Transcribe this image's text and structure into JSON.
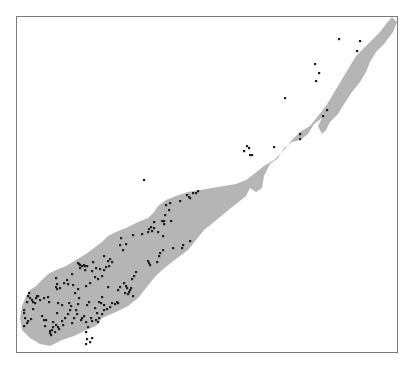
{
  "map": {
    "frame": {
      "x": 16,
      "y": 16,
      "width": 381,
      "height": 336,
      "stroke": "#7a7a7a"
    },
    "colors": {
      "land": "#b5b5b5",
      "points": "#1e1e1e",
      "background": "#ffffff"
    },
    "landmass": {
      "name": "peninsula",
      "outline": [
        [
          392,
          17
        ],
        [
          397,
          22
        ],
        [
          393,
          32
        ],
        [
          384,
          44
        ],
        [
          376,
          52
        ],
        [
          370,
          62
        ],
        [
          366,
          72
        ],
        [
          360,
          82
        ],
        [
          352,
          92
        ],
        [
          344,
          104
        ],
        [
          338,
          114
        ],
        [
          330,
          122
        ],
        [
          326,
          130
        ],
        [
          322,
          134
        ],
        [
          318,
          126
        ],
        [
          322,
          118
        ],
        [
          314,
          124
        ],
        [
          308,
          134
        ],
        [
          300,
          140
        ],
        [
          292,
          142
        ],
        [
          284,
          148
        ],
        [
          278,
          158
        ],
        [
          270,
          164
        ],
        [
          264,
          176
        ],
        [
          262,
          188
        ],
        [
          256,
          192
        ],
        [
          250,
          188
        ],
        [
          246,
          196
        ],
        [
          236,
          204
        ],
        [
          226,
          212
        ],
        [
          214,
          222
        ],
        [
          204,
          230
        ],
        [
          196,
          240
        ],
        [
          188,
          250
        ],
        [
          180,
          256
        ],
        [
          172,
          262
        ],
        [
          162,
          270
        ],
        [
          154,
          278
        ],
        [
          146,
          288
        ],
        [
          138,
          298
        ],
        [
          128,
          306
        ],
        [
          116,
          312
        ],
        [
          102,
          318
        ],
        [
          96,
          326
        ],
        [
          86,
          330
        ],
        [
          74,
          336
        ],
        [
          62,
          340
        ],
        [
          50,
          346
        ],
        [
          40,
          344
        ],
        [
          30,
          338
        ],
        [
          22,
          330
        ],
        [
          20,
          318
        ],
        [
          22,
          306
        ],
        [
          26,
          296
        ],
        [
          30,
          290
        ],
        [
          36,
          286
        ],
        [
          42,
          280
        ],
        [
          48,
          274
        ],
        [
          56,
          270
        ],
        [
          66,
          266
        ],
        [
          76,
          260
        ],
        [
          86,
          254
        ],
        [
          94,
          248
        ],
        [
          102,
          242
        ],
        [
          108,
          236
        ],
        [
          116,
          232
        ],
        [
          126,
          228
        ],
        [
          138,
          222
        ],
        [
          148,
          218
        ],
        [
          154,
          212
        ],
        [
          158,
          206
        ],
        [
          166,
          200
        ],
        [
          176,
          196
        ],
        [
          188,
          192
        ],
        [
          200,
          190
        ],
        [
          212,
          188
        ],
        [
          224,
          186
        ],
        [
          236,
          184
        ],
        [
          246,
          180
        ],
        [
          254,
          174
        ],
        [
          264,
          166
        ],
        [
          274,
          160
        ],
        [
          284,
          150
        ],
        [
          292,
          140
        ],
        [
          300,
          132
        ],
        [
          310,
          126
        ],
        [
          318,
          116
        ],
        [
          326,
          106
        ],
        [
          332,
          96
        ],
        [
          338,
          86
        ],
        [
          344,
          76
        ],
        [
          350,
          66
        ],
        [
          356,
          56
        ],
        [
          364,
          48
        ],
        [
          372,
          40
        ],
        [
          380,
          32
        ],
        [
          386,
          24
        ]
      ]
    },
    "points": [
      [
        339,
        39
      ],
      [
        360,
        41
      ],
      [
        357,
        51
      ],
      [
        315,
        64
      ],
      [
        319,
        73
      ],
      [
        316,
        81
      ],
      [
        285,
        98
      ],
      [
        327,
        110
      ],
      [
        323,
        116
      ],
      [
        300,
        134
      ],
      [
        300,
        139
      ],
      [
        247,
        146
      ],
      [
        249,
        148
      ],
      [
        244,
        151
      ],
      [
        252,
        155
      ],
      [
        250,
        155
      ],
      [
        274,
        147
      ],
      [
        144,
        180
      ],
      [
        187,
        195
      ],
      [
        189,
        197
      ],
      [
        193,
        193
      ],
      [
        196,
        193
      ],
      [
        198,
        191
      ],
      [
        190,
        198
      ],
      [
        180,
        201
      ],
      [
        170,
        203
      ],
      [
        166,
        205
      ],
      [
        169,
        210
      ],
      [
        165,
        215
      ],
      [
        164,
        221
      ],
      [
        162,
        221
      ],
      [
        164,
        224
      ],
      [
        171,
        221
      ],
      [
        154,
        222
      ],
      [
        151,
        227
      ],
      [
        149,
        229
      ],
      [
        152,
        231
      ],
      [
        154,
        228
      ],
      [
        163,
        236
      ],
      [
        148,
        232
      ],
      [
        142,
        234
      ],
      [
        133,
        235
      ],
      [
        121,
        238
      ],
      [
        126,
        244
      ],
      [
        120,
        245
      ],
      [
        123,
        250
      ],
      [
        158,
        232
      ],
      [
        148,
        261
      ],
      [
        163,
        250
      ],
      [
        160,
        253
      ],
      [
        159,
        256
      ],
      [
        190,
        241
      ],
      [
        173,
        248
      ],
      [
        183,
        245
      ],
      [
        182,
        248
      ],
      [
        157,
        262
      ],
      [
        150,
        265
      ],
      [
        149,
        263
      ],
      [
        104,
        256
      ],
      [
        110,
        259
      ],
      [
        108,
        261
      ],
      [
        112,
        262
      ],
      [
        109,
        266
      ],
      [
        104,
        270
      ],
      [
        100,
        269
      ],
      [
        102,
        276
      ],
      [
        106,
        267
      ],
      [
        78,
        263
      ],
      [
        79,
        264
      ],
      [
        80,
        265
      ],
      [
        84,
        265
      ],
      [
        85,
        266
      ],
      [
        87,
        266
      ],
      [
        80,
        268
      ],
      [
        85,
        270
      ],
      [
        82,
        266
      ],
      [
        93,
        262
      ],
      [
        96,
        268
      ],
      [
        92,
        271
      ],
      [
        98,
        279
      ],
      [
        95,
        277
      ],
      [
        90,
        283
      ],
      [
        86,
        286
      ],
      [
        72,
        274
      ],
      [
        67,
        280
      ],
      [
        73,
        285
      ],
      [
        56,
        278
      ],
      [
        57,
        284
      ],
      [
        64,
        283
      ],
      [
        68,
        284
      ],
      [
        60,
        288
      ],
      [
        56,
        287
      ],
      [
        57,
        289
      ],
      [
        75,
        293
      ],
      [
        78,
        289
      ],
      [
        79,
        298
      ],
      [
        108,
        287
      ],
      [
        102,
        297
      ],
      [
        118,
        290
      ],
      [
        120,
        287
      ],
      [
        124,
        283
      ],
      [
        126,
        286
      ],
      [
        127,
        288
      ],
      [
        131,
        288
      ],
      [
        130,
        290
      ],
      [
        129,
        292
      ],
      [
        125,
        293
      ],
      [
        128,
        294
      ],
      [
        133,
        296
      ],
      [
        132,
        279
      ],
      [
        134,
        276
      ],
      [
        136,
        272
      ],
      [
        29,
        293
      ],
      [
        28,
        296
      ],
      [
        30,
        298
      ],
      [
        32,
        300
      ],
      [
        27,
        302
      ],
      [
        33,
        302
      ],
      [
        35,
        303
      ],
      [
        36,
        298
      ],
      [
        37,
        296
      ],
      [
        40,
        300
      ],
      [
        24,
        310
      ],
      [
        24,
        313
      ],
      [
        25,
        318
      ],
      [
        28,
        321
      ],
      [
        31,
        319
      ],
      [
        27,
        323
      ],
      [
        24,
        326
      ],
      [
        38,
        296
      ],
      [
        33,
        309
      ],
      [
        69,
        303
      ],
      [
        71,
        306
      ],
      [
        70,
        310
      ],
      [
        68,
        314
      ],
      [
        78,
        304
      ],
      [
        87,
        305
      ],
      [
        89,
        302
      ],
      [
        99,
        302
      ],
      [
        101,
        303
      ],
      [
        104,
        305
      ],
      [
        104,
        310
      ],
      [
        107,
        309
      ],
      [
        110,
        307
      ],
      [
        112,
        303
      ],
      [
        115,
        304
      ],
      [
        117,
        302
      ],
      [
        102,
        314
      ],
      [
        99,
        318
      ],
      [
        96,
        320
      ],
      [
        97,
        313
      ],
      [
        95,
        308
      ],
      [
        118,
        303
      ],
      [
        98,
        322
      ],
      [
        88,
        327
      ],
      [
        86,
        322
      ],
      [
        81,
        320
      ],
      [
        82,
        318
      ],
      [
        84,
        316
      ],
      [
        91,
        318
      ],
      [
        92,
        321
      ],
      [
        77,
        314
      ],
      [
        76,
        310
      ],
      [
        74,
        318
      ],
      [
        72,
        323
      ],
      [
        65,
        318
      ],
      [
        62,
        321
      ],
      [
        63,
        325
      ],
      [
        58,
        327
      ],
      [
        56,
        325
      ],
      [
        53,
        322
      ],
      [
        53,
        327
      ],
      [
        50,
        331
      ],
      [
        50,
        333
      ],
      [
        51,
        335
      ],
      [
        55,
        332
      ],
      [
        52,
        330
      ],
      [
        59,
        329
      ],
      [
        45,
        326
      ],
      [
        44,
        320
      ],
      [
        42,
        316
      ],
      [
        46,
        320
      ],
      [
        57,
        313
      ],
      [
        62,
        305
      ],
      [
        58,
        303
      ],
      [
        48,
        297
      ],
      [
        44,
        298
      ],
      [
        49,
        302
      ],
      [
        86,
        332
      ],
      [
        87,
        339
      ],
      [
        90,
        342
      ],
      [
        92,
        338
      ],
      [
        86,
        344
      ]
    ]
  }
}
